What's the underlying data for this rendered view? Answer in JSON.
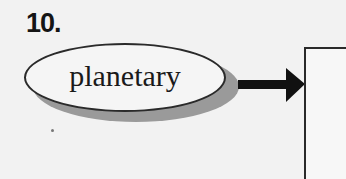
{
  "item": {
    "number": "10.",
    "term": "planetary"
  },
  "diagram": {
    "nodes": [
      {
        "id": "term-oval",
        "shape": "ellipse",
        "label": "planetary"
      },
      {
        "id": "answer-box",
        "shape": "rectangle",
        "label": ""
      }
    ],
    "edges": [
      {
        "from": "term-oval",
        "to": "answer-box",
        "style": "bold-arrow"
      }
    ]
  },
  "colors": {
    "ink": "#1a1a1a",
    "shadow": "#9a9a9a",
    "paper": "#f2f2f2"
  }
}
